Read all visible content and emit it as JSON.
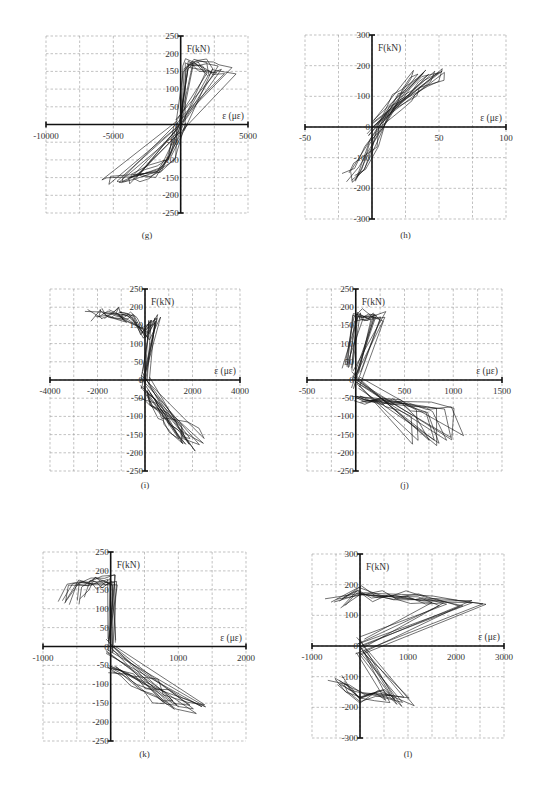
{
  "chart_data": [
    {
      "id": "g",
      "type": "line",
      "caption": "(g)",
      "title": "",
      "xlabel": "ε (με)",
      "ylabel": "F(kN)",
      "xlim": [
        -10000,
        5000
      ],
      "ylim": [
        -250,
        250
      ],
      "xticks": [
        -10000,
        -5000,
        5000
      ],
      "yticks": [
        250,
        200,
        150,
        100,
        50,
        0,
        -50,
        -100,
        -150,
        -200,
        -250
      ],
      "grid": true,
      "description": "Hysteresis loops: tension branch near 0–3500 με up to ~190 kN; compression branch spreading to ~-5500 με at ~-170 kN",
      "series": [
        {
          "name": "envelope-positive",
          "x": [
            0,
            500,
            1000,
            2000,
            3000,
            3500
          ],
          "y": [
            0,
            180,
            190,
            185,
            170,
            160
          ]
        },
        {
          "name": "envelope-negative",
          "x": [
            0,
            -1000,
            -2000,
            -3500,
            -5000,
            -5500
          ],
          "y": [
            0,
            -100,
            -130,
            -150,
            -165,
            -170
          ]
        }
      ]
    },
    {
      "id": "h",
      "type": "line",
      "caption": "(h)",
      "title": "",
      "xlabel": "ε (με)",
      "ylabel": "F(kN)",
      "xlim": [
        -50,
        100
      ],
      "ylim": [
        -300,
        300
      ],
      "xticks": [
        -50,
        0,
        50,
        100
      ],
      "yticks": [
        300,
        200,
        100,
        0,
        -100,
        -200,
        -300
      ],
      "grid": true,
      "description": "Narrow diagonal band of loops from about (-20,-180) to (58,190)",
      "series": [
        {
          "name": "band",
          "x": [
            -20,
            -10,
            0,
            10,
            20,
            30,
            40,
            50,
            58
          ],
          "y": [
            -180,
            -150,
            -60,
            0,
            60,
            100,
            130,
            165,
            190
          ]
        }
      ]
    },
    {
      "id": "i",
      "type": "line",
      "caption": "(i)",
      "title": "",
      "xlabel": "ε (με)",
      "ylabel": "F(kN)",
      "xlim": [
        -4000,
        4000
      ],
      "ylim": [
        -250,
        250
      ],
      "xticks": [
        -4000,
        -2000,
        0,
        2000,
        4000
      ],
      "yticks": [
        250,
        200,
        150,
        100,
        50,
        0,
        -50,
        -100,
        -150,
        -200,
        -250
      ],
      "grid": true,
      "description": "Vertical loading branches at ~-2600 to 1000 με reaching ~190 kN; compression branches sloping to ~2500 με at -190 kN",
      "series": [
        {
          "name": "peaks-positive-x",
          "x": [
            -2600,
            -2100,
            -1700,
            -1400,
            -1100,
            -800,
            0,
            500
          ],
          "y": [
            190,
            193,
            193,
            190,
            185,
            185,
            140,
            185
          ]
        },
        {
          "name": "negative-envelope",
          "x": [
            0,
            500,
            1000,
            1500,
            2000,
            2500
          ],
          "y": [
            -40,
            -70,
            -100,
            -130,
            -160,
            -190
          ]
        }
      ]
    },
    {
      "id": "j",
      "type": "line",
      "caption": "(j)",
      "title": "",
      "xlabel": "ε (με)",
      "ylabel": "F(kN)",
      "xlim": [
        -500,
        1500
      ],
      "ylim": [
        -250,
        250
      ],
      "xticks": [
        -500,
        0,
        500,
        1000,
        1500
      ],
      "yticks": [
        250,
        200,
        150,
        100,
        50,
        0,
        -50,
        -100,
        -150,
        -200,
        -250
      ],
      "grid": true,
      "description": "Steep loading branches near 0–300 με up to ~190 kN; compression plateau ~-60 to -100 kN extending to ~1100 με, minimum ~-190 kN",
      "series": [
        {
          "name": "positive-branches",
          "x": [
            -100,
            0,
            100,
            200,
            300
          ],
          "y": [
            40,
            190,
            190,
            195,
            190
          ]
        },
        {
          "name": "negative-plateau",
          "x": [
            0,
            200,
            400,
            600,
            800,
            1000,
            1100
          ],
          "y": [
            -55,
            -60,
            -65,
            -70,
            -80,
            -95,
            -190
          ]
        }
      ]
    },
    {
      "id": "k",
      "type": "line",
      "caption": "(k)",
      "title": "",
      "xlabel": "ε (με)",
      "ylabel": "F(kN)",
      "xlim": [
        -1000,
        2000
      ],
      "ylim": [
        -250,
        250
      ],
      "xticks": [
        -1000,
        0,
        1000,
        2000
      ],
      "yticks": [
        250,
        200,
        150,
        100,
        50,
        0,
        -50,
        -100,
        -150,
        -200,
        -250
      ],
      "grid": true,
      "description": "Positive loops clustered -750 to 0 με up to ~185 kN; negative envelope sloping to ~1500 με at ~-180 kN",
      "series": [
        {
          "name": "positive-cluster",
          "x": [
            -750,
            -600,
            -400,
            -200,
            0
          ],
          "y": [
            130,
            185,
            185,
            185,
            190
          ]
        },
        {
          "name": "negative-envelope",
          "x": [
            0,
            300,
            600,
            900,
            1200,
            1500
          ],
          "y": [
            -60,
            -80,
            -110,
            -135,
            -160,
            -180
          ]
        }
      ]
    },
    {
      "id": "l",
      "type": "line",
      "caption": "(l)",
      "title": "",
      "xlabel": "ε (με)",
      "ylabel": "F(kN)",
      "xlim": [
        -1000,
        3000
      ],
      "ylim": [
        -300,
        300
      ],
      "xticks": [
        -1000,
        0,
        1000,
        2000,
        3000
      ],
      "yticks": [
        300,
        200,
        100,
        0,
        -100,
        -200,
        -300
      ],
      "grid": true,
      "description": "Loops with positive plateau ~150–190 kN extending to ~2700 με; negative loops from -600 to ~1000 με down to ~-190 kN",
      "series": [
        {
          "name": "positive-plateau",
          "x": [
            -600,
            0,
            500,
            1000,
            1500,
            2000,
            2700
          ],
          "y": [
            150,
            190,
            180,
            170,
            165,
            160,
            150
          ]
        },
        {
          "name": "negative-lobe",
          "x": [
            -600,
            -300,
            0,
            500,
            1000
          ],
          "y": [
            -120,
            -150,
            -180,
            -170,
            -190
          ]
        }
      ]
    }
  ],
  "figure": {
    "caption_text": ""
  }
}
